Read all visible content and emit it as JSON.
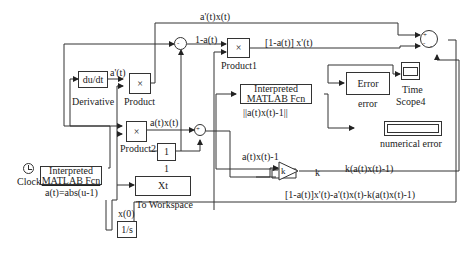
{
  "diagram": {
    "type": "simulink-block-diagram",
    "blocks": {
      "derivative": {
        "text": "du/dt",
        "name": "Derivative"
      },
      "product": {
        "text": "×",
        "name": "Product"
      },
      "product1": {
        "text": "×",
        "name": "Product1"
      },
      "product2": {
        "text": "×",
        "name": "Product2"
      },
      "constant": {
        "text": "1",
        "name": "1"
      },
      "to_workspace": {
        "text": "Xt",
        "name": "To Workspace"
      },
      "integrator": {
        "text": "1/s",
        "name": "x(0)"
      },
      "clock": {
        "name": "Clock"
      },
      "fcn_a": {
        "line1": "Interpreted",
        "line2": "MATLAB Fcn",
        "name": "a(t)=abs(u-1)"
      },
      "fcn_err": {
        "line1": "Interpreted",
        "line2": "MATLAB Fcn",
        "name": "||a(t)x(t)-1||"
      },
      "error_block": {
        "text": "Error",
        "name": "error"
      },
      "scope": {
        "name_line1": "Time",
        "name_line2": "Scope4"
      },
      "display": {
        "name": "numerical error"
      },
      "gain": {
        "text": "k",
        "name": "k"
      }
    },
    "signals": {
      "a_prime_x": "a'(t)x(t)",
      "one_minus_a": "1-a(t)",
      "one_minus_a_xprime": "[1-a(t)] x'(t)",
      "a_prime": "a'(t)",
      "a_x": "a(t)x(t)",
      "a_x_minus_1": "a(t)x(t)-1",
      "k_term": "k(a(t)x(t)-1)",
      "feedback": "[1-a(t)]x'(t)-a'(t)x(t)-k(a(t)x(t)-1)"
    },
    "sum_signs": {
      "sum1": [
        "-",
        "+"
      ],
      "sum2": [
        "+",
        "-"
      ],
      "sum_out": [
        "+",
        "-",
        "-"
      ]
    }
  }
}
